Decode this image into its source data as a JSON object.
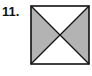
{
  "problem": {
    "number_label": "11.",
    "figure": {
      "shape": "square",
      "divisions": "two diagonals forming four triangles",
      "shaded_triangles": [
        "left",
        "right"
      ],
      "unshaded_triangles": [
        "top",
        "bottom"
      ],
      "shade_color": "#b3b3b3",
      "stroke_color": "#111111",
      "background_color": "#ffffff"
    }
  }
}
